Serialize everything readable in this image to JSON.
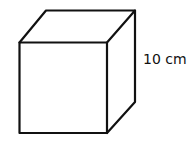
{
  "diagram": {
    "shape": "cube",
    "dimension_label": "10 cm",
    "stroke_color": "#111111",
    "background": "#ffffff"
  }
}
